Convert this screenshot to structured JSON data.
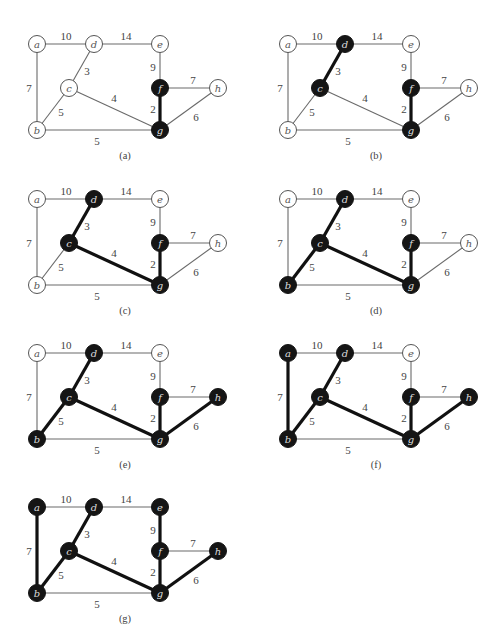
{
  "figure": {
    "type": "graph-sequence",
    "nodes": [
      {
        "id": "a",
        "x": 37,
        "y": 44
      },
      {
        "id": "d",
        "x": 94,
        "y": 44
      },
      {
        "id": "e",
        "x": 160,
        "y": 44
      },
      {
        "id": "c",
        "x": 69,
        "y": 88
      },
      {
        "id": "f",
        "x": 160,
        "y": 88
      },
      {
        "id": "h",
        "x": 218,
        "y": 88
      },
      {
        "id": "b",
        "x": 37,
        "y": 130
      },
      {
        "id": "g",
        "x": 160,
        "y": 130
      }
    ],
    "edges": [
      {
        "from": "a",
        "to": "d",
        "weight": "10",
        "lx": 66,
        "ly": 36
      },
      {
        "from": "d",
        "to": "e",
        "weight": "14",
        "lx": 126,
        "ly": 36
      },
      {
        "from": "a",
        "to": "b",
        "weight": "7",
        "lx": 29,
        "ly": 88
      },
      {
        "from": "d",
        "to": "c",
        "weight": "3",
        "lx": 87,
        "ly": 71
      },
      {
        "from": "c",
        "to": "b",
        "weight": "5",
        "lx": 61,
        "ly": 112
      },
      {
        "from": "c",
        "to": "g",
        "weight": "4",
        "lx": 114,
        "ly": 98
      },
      {
        "from": "e",
        "to": "f",
        "weight": "9",
        "lx": 153,
        "ly": 67
      },
      {
        "from": "f",
        "to": "h",
        "weight": "7",
        "lx": 193,
        "ly": 80
      },
      {
        "from": "f",
        "to": "g",
        "weight": "2",
        "lx": 153,
        "ly": 109
      },
      {
        "from": "h",
        "to": "g",
        "weight": "6",
        "lx": 196,
        "ly": 117
      },
      {
        "from": "b",
        "to": "g",
        "weight": "5",
        "lx": 97,
        "ly": 141
      }
    ],
    "panels": [
      {
        "label": "(a)",
        "ox": 0,
        "oy": 0,
        "in_tree": [
          "f",
          "g"
        ],
        "tree_edges": [
          "f-g"
        ]
      },
      {
        "label": "(b)",
        "ox": 251,
        "oy": 0,
        "in_tree": [
          "d",
          "c",
          "f",
          "g"
        ],
        "tree_edges": [
          "d-c",
          "f-g"
        ]
      },
      {
        "label": "(c)",
        "ox": 0,
        "oy": 155,
        "in_tree": [
          "d",
          "c",
          "f",
          "g"
        ],
        "tree_edges": [
          "d-c",
          "c-g",
          "f-g"
        ]
      },
      {
        "label": "(d)",
        "ox": 251,
        "oy": 155,
        "in_tree": [
          "d",
          "c",
          "b",
          "f",
          "g"
        ],
        "tree_edges": [
          "d-c",
          "c-b",
          "c-g",
          "f-g"
        ]
      },
      {
        "label": "(e)",
        "ox": 0,
        "oy": 309,
        "in_tree": [
          "d",
          "c",
          "b",
          "f",
          "g",
          "h"
        ],
        "tree_edges": [
          "d-c",
          "c-b",
          "c-g",
          "f-g",
          "h-g"
        ]
      },
      {
        "label": "(f)",
        "ox": 251,
        "oy": 309,
        "in_tree": [
          "a",
          "d",
          "c",
          "b",
          "f",
          "g",
          "h"
        ],
        "tree_edges": [
          "a-b",
          "d-c",
          "c-b",
          "c-g",
          "f-g",
          "h-g"
        ]
      },
      {
        "label": "(g)",
        "ox": 0,
        "oy": 463,
        "in_tree": [
          "a",
          "d",
          "e",
          "c",
          "b",
          "f",
          "g",
          "h"
        ],
        "tree_edges": [
          "a-b",
          "d-c",
          "c-b",
          "c-g",
          "e-f",
          "f-g",
          "h-g"
        ]
      }
    ],
    "caption_offset": {
      "x": 125,
      "y": 155
    },
    "node_radius": 8.5
  }
}
